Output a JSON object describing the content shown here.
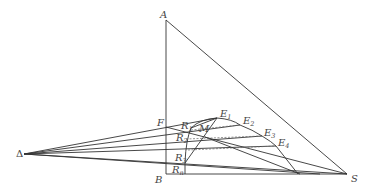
{
  "diagram": {
    "type": "triangular extraction diagram (multistage countercurrent)",
    "stroke_color": "#333333",
    "points": {
      "A": {
        "label": "A",
        "x": 166,
        "y": 20
      },
      "B": {
        "label": "B",
        "x": 166,
        "y": 174
      },
      "S": {
        "label": "S",
        "x": 347,
        "y": 174
      },
      "Delta": {
        "label": "Δ",
        "x": 24,
        "y": 154
      },
      "F": {
        "label": "F",
        "x": 166,
        "y": 127
      },
      "M": {
        "label": "M",
        "x": 206,
        "y": 131
      },
      "E1": {
        "label": "E",
        "sub": "1",
        "x": 217,
        "y": 118
      },
      "E2": {
        "label": "E",
        "sub": "2",
        "x": 240,
        "y": 125
      },
      "E3": {
        "label": "E",
        "sub": "3",
        "x": 262,
        "y": 136
      },
      "E4": {
        "label": "E",
        "sub": "4",
        "x": 276,
        "y": 146
      },
      "R1": {
        "label": "R",
        "sub": "1",
        "x": 191,
        "y": 128
      },
      "R2": {
        "label": "R",
        "sub": "2",
        "x": 186,
        "y": 139
      },
      "R3": {
        "label": "R",
        "sub": "3",
        "x": 185,
        "y": 162
      },
      "Rn": {
        "label": "R",
        "sub": "n",
        "x": 185,
        "y": 172
      }
    }
  }
}
